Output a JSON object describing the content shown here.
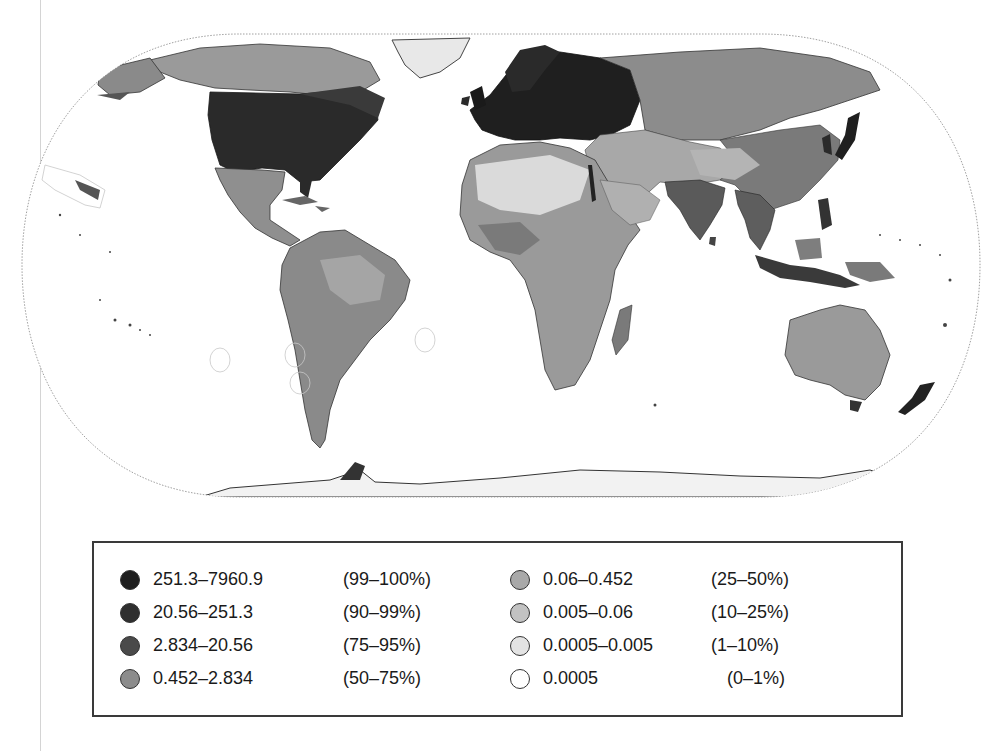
{
  "figure": {
    "type": "choropleth-world-map",
    "projection": "Eckert IV (pseudocylindrical equal-area)",
    "map_style": "grayscale density shading with country borders and maritime boundary outlines"
  },
  "map": {
    "regions_darkest": [
      "Eastern United States",
      "Europe",
      "Japan",
      "Eastern China coast",
      "Java",
      "Nile delta"
    ],
    "regions_medium": [
      "Mexico",
      "South America",
      "Sub-Saharan Africa",
      "India",
      "Southeast Asia",
      "Russia",
      "Australia"
    ],
    "regions_lightest": [
      "Sahara",
      "Greenland",
      "Northern Canada",
      "Siberia",
      "Tibetan Plateau",
      "Antarctica"
    ]
  },
  "legend": {
    "items": [
      {
        "range": "251.3–7960.9",
        "percentile": "(99–100%)",
        "color": "#1e1e1e"
      },
      {
        "range": "20.56–251.3",
        "percentile": "(90–99%)",
        "color": "#2f2f2f"
      },
      {
        "range": "2.834–20.56",
        "percentile": "(75–95%)",
        "color": "#4a4a4a"
      },
      {
        "range": "0.452–2.834",
        "percentile": "(50–75%)",
        "color": "#8c8c8c"
      },
      {
        "range": "0.06–0.452",
        "percentile": "(25–50%)",
        "color": "#a9a9a9"
      },
      {
        "range": "0.005–0.06",
        "percentile": "(10–25%)",
        "color": "#c2c2c2"
      },
      {
        "range": "0.0005–0.005",
        "percentile": "(1–10%)",
        "color": "#e3e3e3"
      },
      {
        "range": "0.0005",
        "percentile": "(0–1%)",
        "color": "#ffffff"
      }
    ]
  },
  "colors": {
    "ocean": "#ffffff",
    "outline": "#9a9a9a",
    "border": "#3a3a3a",
    "eez_outline": "#c8c8c8"
  }
}
